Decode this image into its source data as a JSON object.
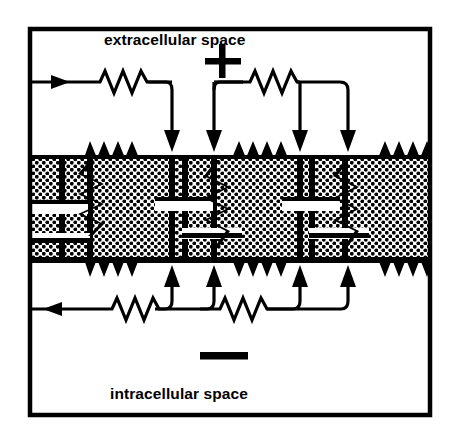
{
  "figure": {
    "kind": "electrical-equivalent-circuit-diagram",
    "background_color": "#ffffff",
    "ink_color": "#000000",
    "frame": {
      "name": "outer-border",
      "x": 28,
      "y": 27,
      "width": 404,
      "height": 390,
      "stroke_width": 4
    }
  },
  "labels": {
    "extracellular": "extracellular space",
    "intracellular": "intracellular space",
    "plus_sign": "+",
    "minus_sign": "—"
  },
  "polarity": {
    "top_symbol": "+",
    "top_symbol_x": 222,
    "top_symbol_y": 62,
    "bottom_symbol": "-",
    "bottom_symbol_x": 224,
    "bottom_symbol_y": 357
  },
  "membrane": {
    "name": "membrane-band",
    "top_y": 155,
    "bottom_y": 263,
    "left_x": 28,
    "right_x": 432,
    "fill_pattern": "stipple-dots",
    "edge_style": "thick-black-with-zigzag",
    "dot_color": "#000000",
    "dot_spacing": 7,
    "dot_radius": 1.9
  },
  "circuit": {
    "extracellular_wire": {
      "name": "extracellular-current-path",
      "y": 82,
      "direction": "rightward",
      "arrow_x": 60,
      "resistors": [
        {
          "x1": 93,
          "x2": 148,
          "peaks": 4
        },
        {
          "x1": 243,
          "x2": 300,
          "peaks": 4
        }
      ],
      "branch_drops_x": [
        172,
        214,
        300,
        348
      ]
    },
    "intracellular_wire": {
      "name": "intracellular-current-path",
      "y": 309,
      "direction": "leftward",
      "arrow_x": 48,
      "resistors": [
        {
          "x1": 105,
          "x2": 160,
          "peaks": 4
        },
        {
          "x1": 213,
          "x2": 268,
          "peaks": 4
        }
      ],
      "branch_rises_x": [
        172,
        214,
        300,
        348
      ]
    },
    "membrane_units": [
      {
        "name": "membrane-unit-1",
        "capacitor_x": 62,
        "resistor_x": 90,
        "plate_top_y": 208,
        "plate_bottom_y": 234
      },
      {
        "name": "membrane-unit-2",
        "capacitor_x": 185,
        "resistor_x": 216,
        "plate_top_y": 202,
        "plate_bottom_y": 231
      },
      {
        "name": "membrane-unit-3",
        "capacitor_x": 312,
        "resistor_x": 345,
        "plate_top_y": 203,
        "plate_bottom_y": 231
      }
    ],
    "vertical_rails_x": [
      62,
      90,
      172,
      185,
      214,
      216,
      300,
      312,
      345,
      348
    ],
    "component_counts": {
      "extracellular_resistors": 2,
      "intracellular_resistors": 2,
      "membrane_capacitors": 3,
      "membrane_resistors": 3,
      "downward_arrows": 4,
      "upward_arrows": 4,
      "flow_arrows": 2
    }
  }
}
